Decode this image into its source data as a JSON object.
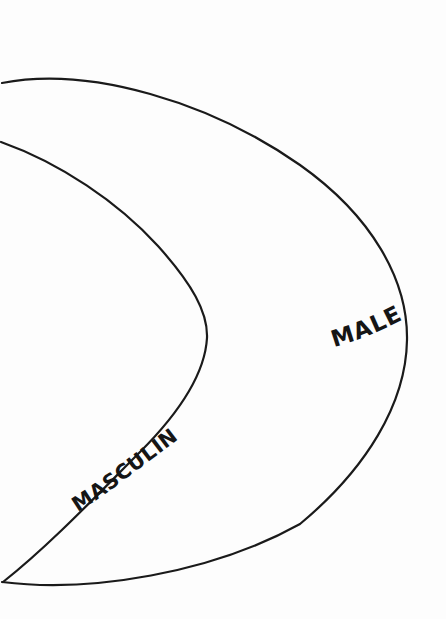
{
  "page": {
    "background_color": "#fdfdfd",
    "ink_color": "#1a1a1a",
    "width": 446,
    "height": 619
  },
  "diagram": {
    "type": "nested-set-diagram",
    "title": "",
    "regions": [
      {
        "id": "outer-region",
        "label": "MALE",
        "label_x": 372,
        "label_y": 333,
        "label_rotation": -13,
        "description": "outer crescent boundary"
      },
      {
        "id": "inner-region",
        "label": "MASCULINE",
        "label_x": 128,
        "label_y": 474,
        "label_rotation": -38,
        "description": "inner crescent boundary"
      }
    ],
    "shapes": {
      "outer_curve_path": "M 2 83 C 90 66 210 102 300 165 C 372 216 408 280 407 340 C 406 404 366 469 300 524 C 212 573 90 593 2 582",
      "inner_curve_path": "M 1 142 C 60 163 118 202 158 246 C 192 284 208 312 207 338 C 205 372 180 412 140 452 C 100 492 50 545 3 582"
    },
    "labels": {
      "male": "MALE",
      "masculine": "MASCULINE"
    }
  }
}
